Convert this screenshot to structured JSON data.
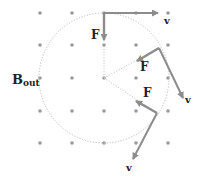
{
  "diagram": {
    "field_label": {
      "main": "B",
      "sub": "out"
    },
    "grid": {
      "xs": [
        40,
        72,
        104,
        136,
        168
      ],
      "ys": [
        13,
        45,
        78,
        111,
        143
      ],
      "dot_color": "#9a9a9a"
    },
    "orbit": {
      "cx": 104,
      "cy": 78,
      "r": 65,
      "color": "#bbbbbb"
    },
    "vectors": [
      {
        "kind": "v",
        "label": "v",
        "x1": 104,
        "y1": 13,
        "x2": 158,
        "y2": 13,
        "lx": 164,
        "ly": 24
      },
      {
        "kind": "F",
        "label": "F",
        "x1": 104,
        "y1": 13,
        "x2": 104,
        "y2": 40,
        "lx": 91,
        "ly": 39
      },
      {
        "kind": "v",
        "label": "v",
        "x1": 159,
        "y1": 48,
        "x2": 183,
        "y2": 98,
        "lx": 185,
        "ly": 103
      },
      {
        "kind": "F",
        "label": "F",
        "x1": 159,
        "y1": 48,
        "x2": 137,
        "y2": 61,
        "lx": 140,
        "ly": 71
      },
      {
        "kind": "v",
        "label": "v",
        "x1": 157,
        "y1": 113,
        "x2": 133,
        "y2": 159,
        "lx": 126,
        "ly": 171
      },
      {
        "kind": "F",
        "label": "F",
        "x1": 157,
        "y1": 113,
        "x2": 136,
        "y2": 101,
        "lx": 143,
        "ly": 97
      }
    ],
    "radii": [
      {
        "x1": 104,
        "y1": 78,
        "x2": 104,
        "y2": 13
      },
      {
        "x1": 104,
        "y1": 78,
        "x2": 159,
        "y2": 48
      },
      {
        "x1": 104,
        "y1": 78,
        "x2": 157,
        "y2": 113
      }
    ],
    "colors": {
      "vector": "#8c8c8c",
      "label": "#222222"
    }
  }
}
